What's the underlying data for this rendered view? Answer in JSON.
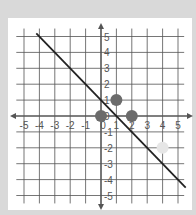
{
  "chart_data": {
    "type": "scatter",
    "title": "",
    "xlabel": "",
    "ylabel": "",
    "xlim": [
      -5,
      5
    ],
    "ylim": [
      -5,
      5
    ],
    "grid": true,
    "x_ticks": [
      "-5",
      "-4",
      "-3",
      "-2",
      "-1",
      "0",
      "1",
      "2",
      "3",
      "4",
      "5"
    ],
    "y_ticks": [
      "5",
      "4",
      "3",
      "2",
      "1",
      "0",
      "-1",
      "-2",
      "-3",
      "-4",
      "-5"
    ],
    "series": [
      {
        "name": "points",
        "type": "scatter",
        "points": [
          {
            "x": 0,
            "y": 0,
            "color": "#6b6b6b"
          },
          {
            "x": 1,
            "y": 1,
            "color": "#6b6b6b"
          },
          {
            "x": 2,
            "y": 0,
            "color": "#6b6b6b"
          },
          {
            "x": 4,
            "y": -2,
            "color": "#e6e6e6"
          }
        ]
      },
      {
        "name": "line",
        "type": "line",
        "equation": "y = -x + 1",
        "x": [
          -4.2,
          5.5
        ],
        "y": [
          5.2,
          -4.5
        ],
        "color": "#222222"
      }
    ]
  },
  "colors": {
    "background": "#d9d9d9",
    "panel": "#ffffff",
    "grid": "#555555",
    "axis": "#555555"
  }
}
